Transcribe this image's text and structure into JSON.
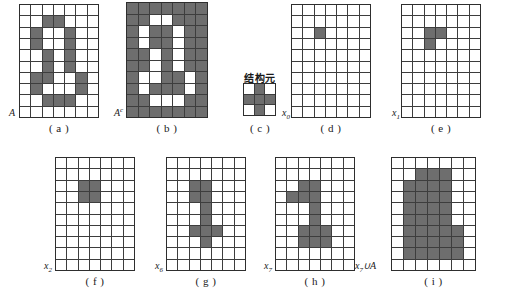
{
  "figure": {
    "title": "",
    "colors": {
      "filled": "#6e6e6e",
      "empty": "#ffffff",
      "gridline": "#3d3d3d",
      "background": "#ffffff"
    },
    "structuring_element_title": "结构元",
    "panels": [
      {
        "id": "a",
        "caption": "( a )",
        "label": "A",
        "label_sub": "",
        "label_sup": "",
        "rows": 10,
        "cols": 7,
        "cells": [
          [
            0,
            0,
            0,
            0,
            0,
            0,
            0
          ],
          [
            0,
            0,
            1,
            1,
            0,
            0,
            0
          ],
          [
            0,
            1,
            0,
            0,
            1,
            0,
            0
          ],
          [
            0,
            1,
            0,
            0,
            1,
            0,
            0
          ],
          [
            0,
            0,
            1,
            0,
            1,
            0,
            0
          ],
          [
            0,
            0,
            1,
            0,
            1,
            0,
            0
          ],
          [
            0,
            1,
            1,
            0,
            0,
            1,
            0
          ],
          [
            0,
            1,
            0,
            0,
            0,
            1,
            0
          ],
          [
            0,
            0,
            1,
            1,
            1,
            0,
            0
          ],
          [
            0,
            0,
            0,
            0,
            0,
            0,
            0
          ]
        ]
      },
      {
        "id": "b",
        "caption": "( b )",
        "label": "A",
        "label_sub": "",
        "label_sup": "c",
        "rows": 10,
        "cols": 7,
        "cells": [
          [
            1,
            1,
            1,
            1,
            1,
            1,
            1
          ],
          [
            1,
            1,
            0,
            0,
            1,
            1,
            1
          ],
          [
            1,
            0,
            1,
            1,
            0,
            1,
            1
          ],
          [
            1,
            0,
            1,
            1,
            0,
            1,
            1
          ],
          [
            1,
            1,
            0,
            1,
            0,
            1,
            1
          ],
          [
            1,
            1,
            0,
            1,
            0,
            1,
            1
          ],
          [
            1,
            0,
            0,
            1,
            1,
            0,
            1
          ],
          [
            1,
            0,
            1,
            1,
            1,
            0,
            1
          ],
          [
            1,
            1,
            0,
            0,
            0,
            1,
            1
          ],
          [
            1,
            1,
            1,
            1,
            1,
            1,
            1
          ]
        ]
      },
      {
        "id": "c",
        "caption": "( c )",
        "label": "",
        "label_sub": "",
        "label_sup": "",
        "rows": 3,
        "cols": 3,
        "cells": [
          [
            0,
            1,
            0
          ],
          [
            1,
            1,
            1
          ],
          [
            0,
            1,
            0
          ]
        ]
      },
      {
        "id": "d",
        "caption": "( d )",
        "label": "x",
        "label_sub": "0",
        "label_sup": "",
        "rows": 10,
        "cols": 7,
        "cells": [
          [
            0,
            0,
            0,
            0,
            0,
            0,
            0
          ],
          [
            0,
            0,
            0,
            0,
            0,
            0,
            0
          ],
          [
            0,
            0,
            1,
            0,
            0,
            0,
            0
          ],
          [
            0,
            0,
            0,
            0,
            0,
            0,
            0
          ],
          [
            0,
            0,
            0,
            0,
            0,
            0,
            0
          ],
          [
            0,
            0,
            0,
            0,
            0,
            0,
            0
          ],
          [
            0,
            0,
            0,
            0,
            0,
            0,
            0
          ],
          [
            0,
            0,
            0,
            0,
            0,
            0,
            0
          ],
          [
            0,
            0,
            0,
            0,
            0,
            0,
            0
          ],
          [
            0,
            0,
            0,
            0,
            0,
            0,
            0
          ]
        ]
      },
      {
        "id": "e",
        "caption": "( e )",
        "label": "x",
        "label_sub": "1",
        "label_sup": "",
        "rows": 10,
        "cols": 7,
        "cells": [
          [
            0,
            0,
            0,
            0,
            0,
            0,
            0
          ],
          [
            0,
            0,
            0,
            0,
            0,
            0,
            0
          ],
          [
            0,
            0,
            1,
            1,
            0,
            0,
            0
          ],
          [
            0,
            0,
            1,
            0,
            0,
            0,
            0
          ],
          [
            0,
            0,
            0,
            0,
            0,
            0,
            0
          ],
          [
            0,
            0,
            0,
            0,
            0,
            0,
            0
          ],
          [
            0,
            0,
            0,
            0,
            0,
            0,
            0
          ],
          [
            0,
            0,
            0,
            0,
            0,
            0,
            0
          ],
          [
            0,
            0,
            0,
            0,
            0,
            0,
            0
          ],
          [
            0,
            0,
            0,
            0,
            0,
            0,
            0
          ]
        ]
      },
      {
        "id": "f",
        "caption": "( f )",
        "label": "x",
        "label_sub": "2",
        "label_sup": "",
        "rows": 10,
        "cols": 7,
        "cells": [
          [
            0,
            0,
            0,
            0,
            0,
            0,
            0
          ],
          [
            0,
            0,
            0,
            0,
            0,
            0,
            0
          ],
          [
            0,
            0,
            1,
            1,
            0,
            0,
            0
          ],
          [
            0,
            0,
            1,
            1,
            0,
            0,
            0
          ],
          [
            0,
            0,
            0,
            0,
            0,
            0,
            0
          ],
          [
            0,
            0,
            0,
            0,
            0,
            0,
            0
          ],
          [
            0,
            0,
            0,
            0,
            0,
            0,
            0
          ],
          [
            0,
            0,
            0,
            0,
            0,
            0,
            0
          ],
          [
            0,
            0,
            0,
            0,
            0,
            0,
            0
          ],
          [
            0,
            0,
            0,
            0,
            0,
            0,
            0
          ]
        ]
      },
      {
        "id": "g",
        "caption": "( g )",
        "label": "x",
        "label_sub": "6",
        "label_sup": "",
        "rows": 10,
        "cols": 7,
        "cells": [
          [
            0,
            0,
            0,
            0,
            0,
            0,
            0
          ],
          [
            0,
            0,
            0,
            0,
            0,
            0,
            0
          ],
          [
            0,
            0,
            1,
            1,
            0,
            0,
            0
          ],
          [
            0,
            0,
            1,
            1,
            0,
            0,
            0
          ],
          [
            0,
            0,
            0,
            1,
            0,
            0,
            0
          ],
          [
            0,
            0,
            0,
            1,
            0,
            0,
            0
          ],
          [
            0,
            0,
            1,
            1,
            1,
            0,
            0
          ],
          [
            0,
            0,
            0,
            1,
            0,
            0,
            0
          ],
          [
            0,
            0,
            0,
            0,
            0,
            0,
            0
          ],
          [
            0,
            0,
            0,
            0,
            0,
            0,
            0
          ]
        ]
      },
      {
        "id": "h",
        "caption": "( h )",
        "label": "x",
        "label_sub": "7",
        "label_sup": "",
        "rows": 10,
        "cols": 7,
        "cells": [
          [
            0,
            0,
            0,
            0,
            0,
            0,
            0
          ],
          [
            0,
            0,
            0,
            0,
            0,
            0,
            0
          ],
          [
            0,
            0,
            1,
            1,
            0,
            0,
            0
          ],
          [
            0,
            1,
            1,
            1,
            0,
            0,
            0
          ],
          [
            0,
            0,
            0,
            1,
            0,
            0,
            0
          ],
          [
            0,
            0,
            0,
            1,
            0,
            0,
            0
          ],
          [
            0,
            0,
            1,
            1,
            1,
            0,
            0
          ],
          [
            0,
            0,
            1,
            1,
            1,
            0,
            0
          ],
          [
            0,
            0,
            0,
            0,
            0,
            0,
            0
          ],
          [
            0,
            0,
            0,
            0,
            0,
            0,
            0
          ]
        ]
      },
      {
        "id": "i",
        "caption": "( i )",
        "label": "x",
        "label_sub": "7",
        "label_sup": "",
        "label_suffix": "∪A",
        "rows": 10,
        "cols": 7,
        "cells": [
          [
            0,
            0,
            0,
            0,
            0,
            0,
            0
          ],
          [
            0,
            0,
            1,
            1,
            1,
            0,
            0
          ],
          [
            0,
            1,
            1,
            1,
            1,
            0,
            0
          ],
          [
            0,
            1,
            1,
            1,
            1,
            0,
            0
          ],
          [
            0,
            1,
            1,
            1,
            1,
            0,
            0
          ],
          [
            0,
            1,
            1,
            1,
            1,
            0,
            0
          ],
          [
            0,
            1,
            1,
            1,
            1,
            1,
            0
          ],
          [
            0,
            1,
            1,
            1,
            1,
            1,
            0
          ],
          [
            0,
            1,
            1,
            1,
            1,
            1,
            0
          ],
          [
            0,
            0,
            0,
            0,
            0,
            0,
            0
          ]
        ]
      }
    ]
  }
}
